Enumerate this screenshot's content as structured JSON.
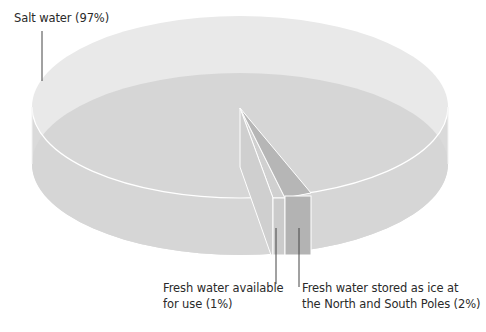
{
  "diagram": {
    "type": "3d-cylinder-pie",
    "title": "",
    "colors": {
      "background": "#ffffff",
      "salt_top": "#e6e6e6",
      "salt_side": "#d7d7d7",
      "salt_inner": "#d3d3d3",
      "fresh_available": "#c9c9c9",
      "ice": "#b3b3b3",
      "edge": "#ffffff",
      "leader": "#444444",
      "text": "#2a2a2a"
    },
    "segments": [
      {
        "name": "Salt water",
        "percent": 97
      },
      {
        "name": "Fresh water available for use",
        "percent": 1
      },
      {
        "name": "Fresh water stored as ice at the North and South Poles",
        "percent": 2
      }
    ]
  },
  "labels": {
    "salt": {
      "text": "Salt water (97%)"
    },
    "fresh": {
      "line1": "Fresh water available",
      "line2": "for use (1%)"
    },
    "ice": {
      "line1": "Fresh water stored as ice at",
      "line2": "the North and South Poles (2%)"
    }
  }
}
